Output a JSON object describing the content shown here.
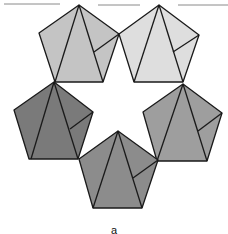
{
  "figure": {
    "bottom_label": "a",
    "top_rules": [
      {
        "x1": 4,
        "y1": 4,
        "x2": 60,
        "y2": 4
      },
      {
        "x1": 98,
        "y1": 5,
        "x2": 140,
        "y2": 5
      },
      {
        "x1": 178,
        "y1": 5,
        "x2": 228,
        "y2": 5
      }
    ],
    "pentagons": [
      {
        "name": "top-left",
        "fill": "#c4c4c4",
        "points": [
          [
            79,
            5
          ],
          [
            119,
            34
          ],
          [
            103,
            82
          ],
          [
            55,
            82
          ],
          [
            39,
            33
          ]
        ],
        "lines": [
          [
            [
              79,
              5
            ],
            [
              55,
              82
            ]
          ],
          [
            [
              79,
              5
            ],
            [
              103,
              82
            ]
          ],
          [
            [
              94,
              52
            ],
            [
              119,
              34
            ]
          ]
        ]
      },
      {
        "name": "top-right",
        "fill": "#dedede",
        "points": [
          [
            159,
            5
          ],
          [
            199,
            35
          ],
          [
            183,
            82
          ],
          [
            134,
            82
          ],
          [
            119,
            34
          ]
        ],
        "lines": [
          [
            [
              159,
              5
            ],
            [
              134,
              82
            ]
          ],
          [
            [
              159,
              5
            ],
            [
              183,
              82
            ]
          ],
          [
            [
              173,
              52
            ],
            [
              199,
              35
            ]
          ]
        ]
      },
      {
        "name": "middle-left",
        "fill": "#7a7a7a",
        "points": [
          [
            54,
            82
          ],
          [
            93,
            112
          ],
          [
            78,
            159
          ],
          [
            29,
            159
          ],
          [
            14,
            110
          ]
        ],
        "lines": [
          [
            [
              54,
              82
            ],
            [
              31,
              159
            ]
          ],
          [
            [
              54,
              82
            ],
            [
              78,
              159
            ]
          ],
          [
            [
              70,
              129
            ],
            [
              93,
              112
            ]
          ]
        ]
      },
      {
        "name": "middle-right",
        "fill": "#9e9e9e",
        "points": [
          [
            183,
            84
          ],
          [
            222,
            113
          ],
          [
            207,
            161
          ],
          [
            157,
            161
          ],
          [
            143,
            112
          ]
        ],
        "lines": [
          [
            [
              183,
              84
            ],
            [
              157,
              161
            ]
          ],
          [
            [
              183,
              84
            ],
            [
              207,
              161
            ]
          ],
          [
            [
              198,
              131
            ],
            [
              222,
              113
            ]
          ]
        ]
      },
      {
        "name": "bottom",
        "fill": "#8c8c8c",
        "points": [
          [
            118,
            131
          ],
          [
            158,
            160
          ],
          [
            142,
            208
          ],
          [
            93,
            208
          ],
          [
            79,
            159
          ]
        ],
        "lines": [
          [
            [
              118,
              131
            ],
            [
              93,
              208
            ]
          ],
          [
            [
              118,
              131
            ],
            [
              142,
              208
            ]
          ],
          [
            [
              133,
              178
            ],
            [
              158,
              160
            ]
          ]
        ]
      }
    ]
  }
}
